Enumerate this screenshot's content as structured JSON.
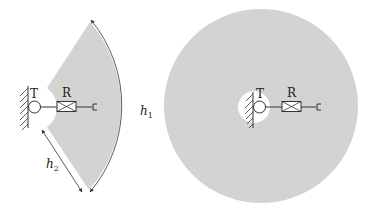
{
  "colors": {
    "coverage_fill": "#d3d3d3",
    "stroke": "#333333",
    "background": "#ffffff"
  },
  "left_diagram": {
    "transmitter_label": "T",
    "receiver_label": "R",
    "dimension_outer_label": "h",
    "dimension_outer_sub": "1",
    "dimension_inner_label": "h",
    "dimension_inner_sub": "2"
  },
  "right_diagram": {
    "transmitter_label": "T",
    "receiver_label": "R"
  }
}
